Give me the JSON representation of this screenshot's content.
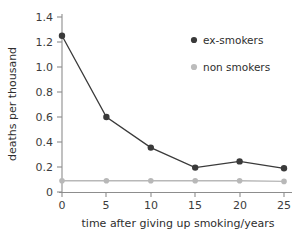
{
  "chart_data": {
    "type": "line",
    "title": "",
    "xlabel": "time after giving up smoking/years",
    "ylabel": "deaths per thousand",
    "x": [
      0,
      5,
      10,
      15,
      20,
      25
    ],
    "xticklabels": [
      "0",
      "5",
      "10",
      "15",
      "20",
      "25"
    ],
    "yticks": [
      0,
      0.2,
      0.4,
      0.6,
      0.8,
      1.0,
      1.2,
      1.4
    ],
    "yticklabels": [
      "0",
      "0.2",
      "0.4",
      "0.6",
      "0.8",
      "1.0",
      "1.2",
      "1.4"
    ],
    "xlim": [
      0,
      25
    ],
    "ylim": [
      0,
      1.4
    ],
    "grid": false,
    "legend_position": "upper-right-inside",
    "series": [
      {
        "name": "ex-smokers",
        "color": "#3a3a3a",
        "marker": "circle",
        "values": [
          1.25,
          0.6,
          0.355,
          0.195,
          0.245,
          0.19
        ]
      },
      {
        "name": "non smokers",
        "color": "#b8b8b8",
        "marker": "circle",
        "values": [
          0.09,
          0.09,
          0.09,
          0.09,
          0.09,
          0.085
        ]
      }
    ]
  },
  "axes": {
    "x_title": "time after giving up smoking/years",
    "y_title": "deaths per thousand"
  },
  "legend": {
    "items": [
      {
        "label": "ex-smokers",
        "color": "#3a3a3a"
      },
      {
        "label": "non smokers",
        "color": "#b8b8b8"
      }
    ]
  },
  "yticklabels": {
    "t0": "0",
    "t1": "0.2",
    "t2": "0.4",
    "t3": "0.6",
    "t4": "0.8",
    "t5": "1.0",
    "t6": "1.2",
    "t7": "1.4"
  },
  "xticklabels": {
    "t0": "0",
    "t1": "5",
    "t2": "10",
    "t3": "15",
    "t4": "20",
    "t5": "25"
  }
}
